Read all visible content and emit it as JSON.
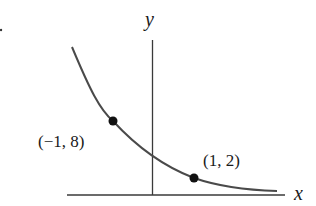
{
  "figure": {
    "type": "function-graph",
    "axes": {
      "x_label": "x",
      "y_label": "y"
    },
    "points": [
      {
        "label": "(−1, 8)",
        "x": -1,
        "y": 8
      },
      {
        "label": "(1, 2)",
        "x": 1,
        "y": 2
      }
    ],
    "stray_mark": "."
  },
  "colors": {
    "curve": "#4a4a4a",
    "axes": "#3a3a3a",
    "points": "#111111",
    "text": "#1a1a1a"
  }
}
